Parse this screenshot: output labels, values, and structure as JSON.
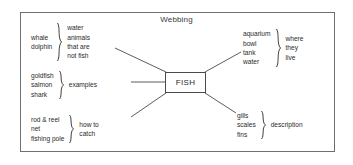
{
  "diagram": {
    "title": "Webbing",
    "center_node": "FISH",
    "branches": [
      {
        "id": "water-animals-not-fish",
        "position": "top-left",
        "examples": [
          "whale",
          "dolphin"
        ],
        "label_lines": [
          "water",
          "animals",
          "that are",
          "not fish"
        ],
        "brace_side": "left-of-label"
      },
      {
        "id": "examples",
        "position": "middle-left",
        "examples": [
          "goldfish",
          "salmon",
          "shark"
        ],
        "label_lines": [
          "examples"
        ],
        "brace_side": "left-of-label"
      },
      {
        "id": "how-to-catch",
        "position": "bottom-left",
        "examples": [
          "rod & reel",
          "net",
          "fishing pole"
        ],
        "label_lines": [
          "how to",
          "catch"
        ],
        "brace_side": "left-of-label"
      },
      {
        "id": "where-they-live",
        "position": "top-right",
        "examples": [
          "aquarium",
          "bowl",
          "tank",
          "water"
        ],
        "label_lines": [
          "where",
          "they",
          "live"
        ],
        "brace_side": "left-of-label"
      },
      {
        "id": "description",
        "position": "bottom-right",
        "examples": [
          "gills",
          "scales",
          "fins"
        ],
        "label_lines": [
          "description"
        ],
        "brace_side": "left-of-label"
      }
    ]
  },
  "text": {
    "title": "Webbing",
    "center": "FISH",
    "tl_examples": "whale\ndolphin",
    "tl_ex_1": "whale",
    "tl_ex_2": "dolphin",
    "tl_label_1": "water",
    "tl_label_2": "animals",
    "tl_label_3": "that are",
    "tl_label_4": "not fish",
    "ml_ex_1": "goldfish",
    "ml_ex_2": "salmon",
    "ml_ex_3": "shark",
    "ml_label_1": "examples",
    "bl_ex_1": "rod & reel",
    "bl_ex_2": "net",
    "bl_ex_3": "fishing pole",
    "bl_label_1": "how to",
    "bl_label_2": "catch",
    "tr_ex_1": "aquarium",
    "tr_ex_2": "bowl",
    "tr_ex_3": "tank",
    "tr_ex_4": "water",
    "tr_label_1": "where",
    "tr_label_2": "they",
    "tr_label_3": "live",
    "br_ex_1": "gills",
    "br_ex_2": "scales",
    "br_ex_3": "fins",
    "br_label_1": "description"
  },
  "colors": {
    "frame_border": "#6f6f6f",
    "line": "#4a4a4a",
    "text": "#2b2b2b",
    "background": "#ffffff"
  }
}
